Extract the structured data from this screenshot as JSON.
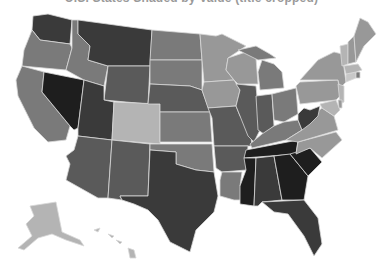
{
  "map": {
    "title": "U.S. States Shaded by Value (title cropped)",
    "legend": null,
    "background": "#ffffff",
    "border_color": "#d8d8d8",
    "shade_scale": {
      "darkest": "#1e1e1e",
      "dark": "#3a3a3a",
      "mid_dark": "#5a5a5a",
      "mid": "#7a7a7a",
      "mid_light": "#989898",
      "light": "#b4b4b4",
      "lightest": "#c8c8c8"
    },
    "states": [
      {
        "abbr": "WA",
        "fill": "#3a3a3a",
        "points": "33,16 48,14 72,20 70,44 40,40 32,30"
      },
      {
        "abbr": "OR",
        "fill": "#7a7a7a",
        "points": "32,30 40,40 70,44 72,48 66,70 22,66 24,50"
      },
      {
        "abbr": "CA",
        "fill": "#7a7a7a",
        "points": "22,66 44,72 42,92 70,126 66,140 48,142 34,128 18,96 16,80"
      },
      {
        "abbr": "NV",
        "fill": "#1e1e1e",
        "points": "44,72 84,80 78,128 74,130 70,126 42,92"
      },
      {
        "abbr": "ID",
        "fill": "#7a7a7a",
        "points": "72,20 78,20 78,34 90,46 88,60 108,66 104,86 84,80 66,70 72,48"
      },
      {
        "abbr": "MT",
        "fill": "#3a3a3a",
        "points": "78,20 152,30 150,66 108,66 88,60 90,46 78,34"
      },
      {
        "abbr": "WY",
        "fill": "#5a5a5a",
        "points": "108,66 150,66 148,104 104,100"
      },
      {
        "abbr": "UT",
        "fill": "#3a3a3a",
        "points": "84,80 104,86 104,100 114,102 112,140 78,136 78,128"
      },
      {
        "abbr": "AZ",
        "fill": "#5a5a5a",
        "points": "78,136 112,140 108,198 98,198 66,180 70,164 66,156 74,150"
      },
      {
        "abbr": "CO",
        "fill": "#b4b4b4",
        "points": "114,102 160,104 160,144 112,140"
      },
      {
        "abbr": "NM",
        "fill": "#5a5a5a",
        "points": "112,140 150,144 148,196 120,196 122,200 108,198"
      },
      {
        "abbr": "ND",
        "fill": "#7a7a7a",
        "points": "152,30 200,34 202,60 150,60"
      },
      {
        "abbr": "SD",
        "fill": "#7a7a7a",
        "points": "150,60 202,60 202,90 190,86 150,84"
      },
      {
        "abbr": "NE",
        "fill": "#5a5a5a",
        "points": "150,84 190,86 202,90 210,112 160,112 160,104 148,104"
      },
      {
        "abbr": "KS",
        "fill": "#7a7a7a",
        "points": "160,112 210,112 212,142 160,142"
      },
      {
        "abbr": "OK",
        "fill": "#7a7a7a",
        "points": "150,144 212,144 214,172 196,170 176,164 176,152 150,150"
      },
      {
        "abbr": "TX",
        "fill": "#3a3a3a",
        "points": "150,150 176,152 176,164 196,170 214,172 218,196 214,212 196,230 190,252 170,242 158,220 148,210 134,204 122,200 120,196 148,196"
      },
      {
        "abbr": "MN",
        "fill": "#989898",
        "points": "200,34 216,36 222,34 246,46 228,58 226,70 234,80 204,82 202,60"
      },
      {
        "abbr": "IA",
        "fill": "#989898",
        "points": "204,82 234,80 240,90 236,106 208,108 202,90"
      },
      {
        "abbr": "MO",
        "fill": "#5a5a5a",
        "points": "208,108 236,106 240,116 250,128 252,146 214,146 212,118"
      },
      {
        "abbr": "AR",
        "fill": "#5a5a5a",
        "points": "214,146 248,146 246,170 222,172 216,168"
      },
      {
        "abbr": "LA",
        "fill": "#7a7a7a",
        "points": "222,172 242,172 240,186 256,186 256,200 234,200 220,196 220,180"
      },
      {
        "abbr": "WI",
        "fill": "#989898",
        "points": "228,58 246,52 256,58 258,84 238,84 234,80 226,70"
      },
      {
        "abbr": "IL",
        "fill": "#5a5a5a",
        "points": "236,84 256,86 260,130 254,142 248,136 240,116 236,106 240,90"
      },
      {
        "abbr": "MI",
        "fill": "#7a7a7a",
        "points": "262,60 274,64 282,72 284,88 260,90 258,72"
      },
      {
        "abbr": "MI-UP",
        "fill": "#7a7a7a",
        "points": "238,50 256,46 270,54 276,58 258,60"
      },
      {
        "abbr": "IN",
        "fill": "#5a5a5a",
        "points": "256,96 272,94 274,126 264,134 258,130"
      },
      {
        "abbr": "OH",
        "fill": "#7a7a7a",
        "points": "272,94 296,88 298,114 284,122 274,120"
      },
      {
        "abbr": "KY",
        "fill": "#7a7a7a",
        "points": "250,144 262,134 274,126 284,122 298,120 302,130 286,140 252,148"
      },
      {
        "abbr": "TN",
        "fill": "#1e1e1e",
        "points": "246,150 298,140 296,154 244,158"
      },
      {
        "abbr": "MS",
        "fill": "#1e1e1e",
        "points": "244,158 256,158 254,206 240,204 240,186 246,170"
      },
      {
        "abbr": "AL",
        "fill": "#3a3a3a",
        "points": "256,158 274,156 282,200 262,202 258,206 254,206"
      },
      {
        "abbr": "GA",
        "fill": "#1e1e1e",
        "points": "274,156 290,154 308,176 304,200 282,200"
      },
      {
        "abbr": "FL",
        "fill": "#3a3a3a",
        "points": "262,202 304,200 318,218 322,244 314,256 304,236 288,214 274,212"
      },
      {
        "abbr": "SC",
        "fill": "#1e1e1e",
        "points": "290,154 310,148 322,162 308,176"
      },
      {
        "abbr": "NC",
        "fill": "#989898",
        "points": "296,154 298,142 336,132 342,140 322,158 310,148"
      },
      {
        "abbr": "VA",
        "fill": "#989898",
        "points": "286,140 302,130 310,118 322,108 334,116 338,130 298,142"
      },
      {
        "abbr": "WV",
        "fill": "#3a3a3a",
        "points": "298,114 304,108 310,110 320,106 318,116 310,124 302,130 298,120"
      },
      {
        "abbr": "PA",
        "fill": "#989898",
        "points": "296,86 300,82 338,80 340,96 336,100 300,104"
      },
      {
        "abbr": "NY",
        "fill": "#989898",
        "points": "300,80 318,60 334,52 342,54 346,82 340,88 338,80"
      },
      {
        "abbr": "MD",
        "fill": "#b4b4b4",
        "points": "320,104 336,100 340,110 334,116 322,108"
      },
      {
        "abbr": "NJ",
        "fill": "#b4b4b4",
        "points": "338,84 344,86 344,102 340,104"
      },
      {
        "abbr": "DE",
        "fill": "#989898",
        "points": "338,100 342,100 342,108 339,108"
      },
      {
        "abbr": "CT",
        "fill": "#c8c8c8",
        "points": "346,74 356,72 356,78 346,82"
      },
      {
        "abbr": "RI",
        "fill": "#7a7a7a",
        "points": "356,72 360,72 360,78 356,78"
      },
      {
        "abbr": "MA",
        "fill": "#b4b4b4",
        "points": "344,66 358,64 362,70 356,72 346,74"
      },
      {
        "abbr": "VT",
        "fill": "#b4b4b4",
        "points": "340,46 348,44 348,64 342,66"
      },
      {
        "abbr": "NH",
        "fill": "#989898",
        "points": "348,42 354,36 356,62 348,64"
      },
      {
        "abbr": "ME",
        "fill": "#989898",
        "points": "354,36 360,18 368,22 376,34 364,46 356,62"
      },
      {
        "abbr": "AK",
        "fill": "#b4b4b4",
        "points": "30,206 56,202 62,232 80,240 84,246 66,240 52,234 38,238 24,250 18,248 32,236 26,224 34,216"
      },
      {
        "abbr": "HI",
        "fill": "#b4b4b4",
        "points": "128,248 134,250 136,258 130,258"
      },
      {
        "abbr": "HI-2",
        "fill": "#b4b4b4",
        "points": "108,234 114,236 112,238"
      },
      {
        "abbr": "HI-3",
        "fill": "#b4b4b4",
        "points": "116,240 122,242 120,244"
      },
      {
        "abbr": "HI-4",
        "fill": "#b4b4b4",
        "points": "94,230 100,228 98,232"
      }
    ]
  }
}
